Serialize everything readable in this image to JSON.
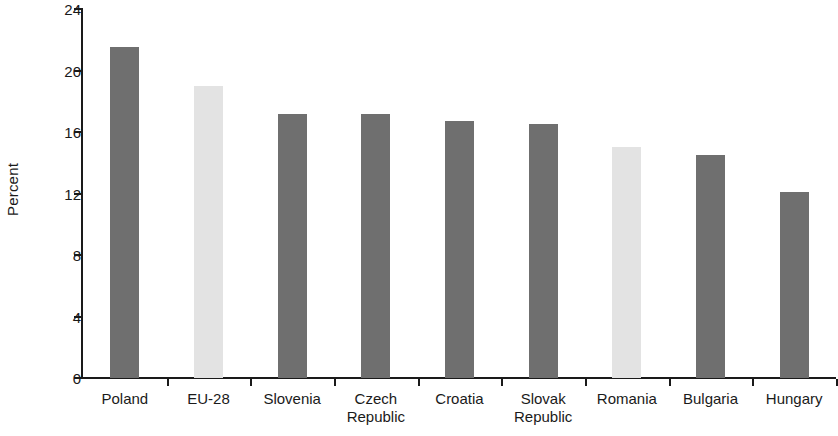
{
  "chart_data": {
    "type": "bar",
    "title": "",
    "xlabel": "",
    "ylabel": "Percent",
    "ylim": [
      0,
      24
    ],
    "yticks": [
      0,
      4,
      8,
      12,
      16,
      20,
      24
    ],
    "ytick_labels": [
      "0",
      "4",
      "8",
      "12",
      "16",
      "20",
      "24"
    ],
    "grid": false,
    "legend": false,
    "categories": [
      "Poland",
      "EU-28",
      "Slovenia",
      "Czech Republic",
      "Croatia",
      "Slovak Republic",
      "Romania",
      "Bulgaria",
      "Hungary"
    ],
    "category_label_lines": [
      [
        "Poland"
      ],
      [
        "EU-28"
      ],
      [
        "Slovenia"
      ],
      [
        "Czech",
        "Republic"
      ],
      [
        "Croatia"
      ],
      [
        "Slovak",
        "Republic"
      ],
      [
        "Romania"
      ],
      [
        "Bulgaria"
      ],
      [
        "Hungary"
      ]
    ],
    "values": [
      21.5,
      19.0,
      17.2,
      17.2,
      16.7,
      16.5,
      15.0,
      14.5,
      12.1
    ],
    "bar_colors": [
      "#6f6f6f",
      "#e3e3e3",
      "#6f6f6f",
      "#6f6f6f",
      "#6f6f6f",
      "#6f6f6f",
      "#e3e3e3",
      "#6f6f6f",
      "#6f6f6f"
    ],
    "colors": {
      "bar_dark": "#6f6f6f",
      "bar_light": "#e3e3e3",
      "axis": "#1a1a1a",
      "text": "#1a1a1a",
      "background": "#ffffff"
    }
  }
}
